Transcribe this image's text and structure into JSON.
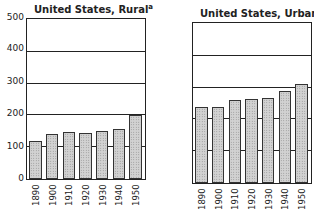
{
  "chart_data": [
    {
      "type": "bar",
      "title": "United States, Rural",
      "title_superscript": "a",
      "categories": [
        "1890",
        "1900",
        "1910",
        "1920",
        "1930",
        "1940",
        "1950"
      ],
      "values": [
        118,
        142,
        148,
        145,
        152,
        158,
        201
      ],
      "xlabel": "",
      "ylabel": "",
      "ylim": [
        0,
        500
      ],
      "yticks": [
        "0",
        "100",
        "200",
        "300",
        "400",
        "500"
      ],
      "grid": true
    },
    {
      "type": "bar",
      "title": "United States, Urban",
      "title_superscript": "a",
      "categories": [
        "1890",
        "1900",
        "1910",
        "1920",
        "1930",
        "1940",
        "1950"
      ],
      "values": [
        240,
        238,
        260,
        265,
        268,
        290,
        310
      ],
      "xlabel": "",
      "ylabel": "",
      "ylim": [
        0,
        500
      ],
      "yticks": [],
      "grid": true
    }
  ],
  "labels": {
    "rural_title": "United States, Rural",
    "urban_title": "United States, Urban",
    "sup": "a",
    "y": [
      "0",
      "100",
      "200",
      "300",
      "400",
      "500"
    ],
    "x": [
      "1890",
      "1900",
      "1910",
      "1920",
      "1930",
      "1940",
      "1950"
    ]
  }
}
